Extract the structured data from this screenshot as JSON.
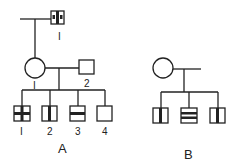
{
  "pedigree_a": {
    "label": "A",
    "grandfather": {
      "label": "I"
    },
    "mother": {
      "label": "I"
    },
    "father": {
      "label": "2"
    },
    "children": [
      {
        "label": "I",
        "pattern": "cross"
      },
      {
        "label": "2",
        "pattern": "vertical-bar"
      },
      {
        "label": "3",
        "pattern": "horizontal-bar"
      },
      {
        "label": "4",
        "pattern": "empty"
      }
    ]
  },
  "pedigree_b": {
    "label": "B",
    "children": [
      {
        "pattern": "vertical-bar"
      },
      {
        "pattern": "double-horizontal-bar"
      },
      {
        "pattern": "vertical-bar"
      }
    ]
  },
  "colors": {
    "line": "#222222",
    "background": "#ffffff"
  }
}
